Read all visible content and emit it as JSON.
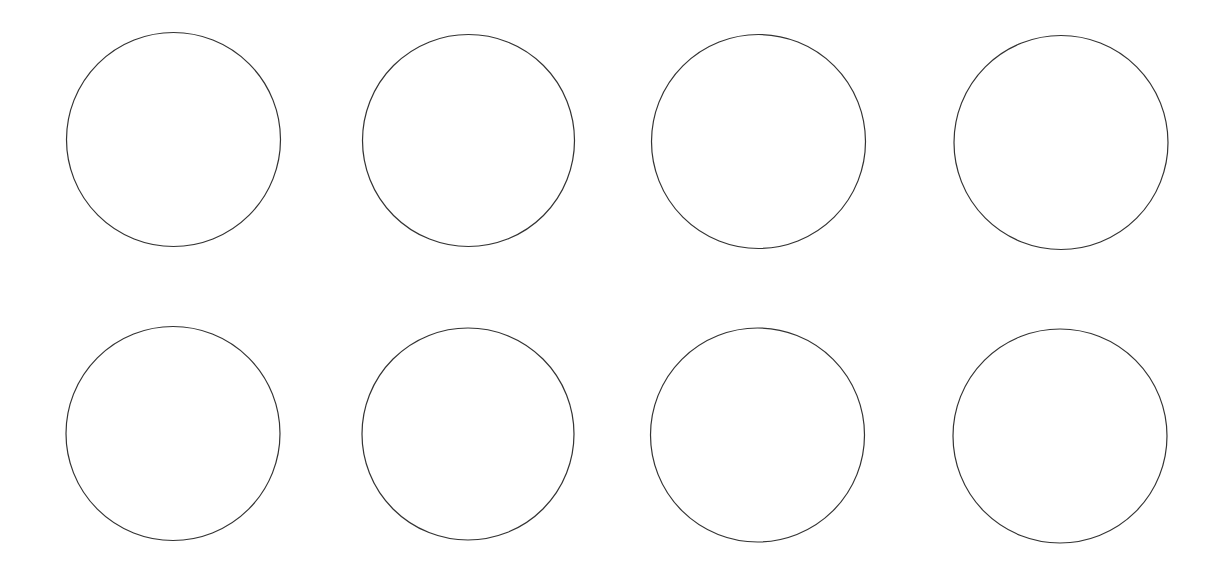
{
  "canvas": {
    "width": 1232,
    "height": 569,
    "background": "#ffffff"
  },
  "style": {
    "stroke": "#333333",
    "stroke_width": 1.2,
    "fill": "none"
  },
  "grid": {
    "rows": 2,
    "columns": 4
  },
  "circles": [
    {
      "row": 1,
      "col": 1,
      "cx": 173.5,
      "cy": 139.5,
      "r": 107
    },
    {
      "row": 1,
      "col": 2,
      "cx": 468.5,
      "cy": 140.5,
      "r": 106
    },
    {
      "row": 1,
      "col": 3,
      "cx": 758.5,
      "cy": 141.5,
      "r": 107
    },
    {
      "row": 1,
      "col": 4,
      "cx": 1061,
      "cy": 142.5,
      "r": 107
    },
    {
      "row": 2,
      "col": 1,
      "cx": 173,
      "cy": 433.5,
      "r": 107
    },
    {
      "row": 2,
      "col": 2,
      "cx": 468,
      "cy": 434,
      "r": 106
    },
    {
      "row": 2,
      "col": 3,
      "cx": 757.5,
      "cy": 435,
      "r": 107
    },
    {
      "row": 2,
      "col": 4,
      "cx": 1060,
      "cy": 436,
      "r": 107
    }
  ]
}
